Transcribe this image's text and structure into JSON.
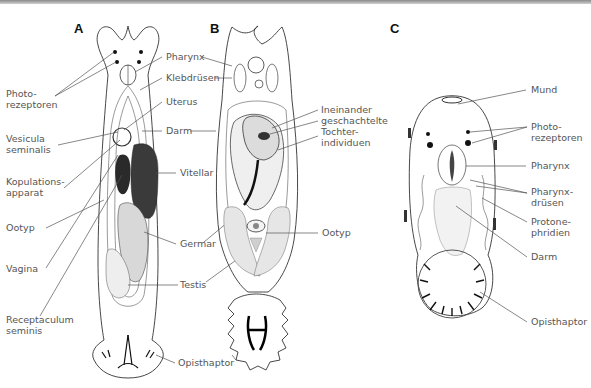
{
  "figure": {
    "panels": [
      {
        "id": "A",
        "label": "A",
        "annotations": {
          "photo": [
            "Photo-",
            "rezeptoren"
          ],
          "vesicula": [
            "Vesicula",
            "seminalis"
          ],
          "kopulation": [
            "Kopulations-",
            "apparat"
          ],
          "ootyp": [
            "Ootyp"
          ],
          "vagina": [
            "Vagina"
          ],
          "receptaculum": [
            "Receptaculum",
            "seminis"
          ]
        }
      },
      {
        "id": "shared_AB",
        "annotations": {
          "pharynx": "Pharynx",
          "klebdruesen": "Klebdrüsen",
          "uterus": "Uterus",
          "darm": "Darm",
          "vitellar": "Vitellar",
          "germar": "Germar",
          "testis": "Testis",
          "opisthaptor": "Opisthaptor"
        }
      },
      {
        "id": "B",
        "label": "B",
        "annotations": {
          "tochter": [
            "Ineinander",
            "geschachtelte",
            "Tochter-",
            "individuen"
          ],
          "ootyp": "Ootyp"
        }
      },
      {
        "id": "C",
        "label": "C",
        "annotations": {
          "mund": "Mund",
          "photo": [
            "Photo-",
            "rezeptoren"
          ],
          "pharynx": "Pharynx",
          "pharynxdruesen": [
            "Pharynx-",
            "drüsen"
          ],
          "protonephridien": [
            "Protone-",
            "phridien"
          ],
          "darm": "Darm",
          "opisthaptor": "Opisthaptor"
        }
      }
    ]
  }
}
